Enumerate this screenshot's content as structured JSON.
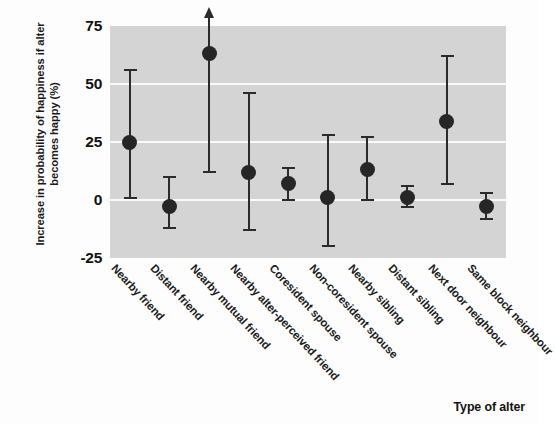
{
  "chart_data": {
    "type": "scatter",
    "title": "",
    "xlabel": "Type of alter",
    "ylabel": "Increase in probability of happiness if alter becomes happy (%)",
    "ylim": [
      -25,
      75
    ],
    "yticks": [
      75,
      50,
      25,
      0,
      -25
    ],
    "ytick_labels": [
      "75",
      "50",
      "25",
      "0",
      "-25"
    ],
    "grid": true,
    "grid_color": "#fafafa",
    "plot_background": "#d4d4d4",
    "marker_color": "#262626",
    "error_bar_color": "#2b2b2b",
    "legend": null,
    "categories": [
      "Nearby friend",
      "Distant friend",
      "Nearby mutual friend",
      "Nearby alter-perceived friend",
      "Coresident spouse",
      "Non-coresident spouse",
      "Nearby sibling",
      "Distant sibling",
      "Next door neighbour",
      "Same block neighbour"
    ],
    "values": [
      25,
      -3,
      63,
      12,
      7,
      1,
      13,
      1,
      34,
      -3
    ],
    "ci_lower": [
      1,
      -12,
      12,
      -13,
      0,
      -20,
      0,
      -3,
      7,
      -8
    ],
    "ci_upper": [
      56,
      10,
      75,
      46,
      14,
      28,
      27,
      6,
      62,
      3
    ],
    "upper_truncated": [
      false,
      false,
      true,
      false,
      false,
      false,
      false,
      false,
      false,
      false
    ],
    "annotations": [
      {
        "category": "Nearby mutual friend",
        "note": "upper confidence limit extends beyond axis maximum (arrow)"
      }
    ]
  }
}
